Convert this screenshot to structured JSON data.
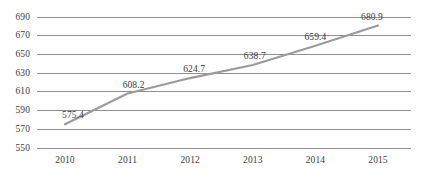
{
  "chart_data": {
    "type": "line",
    "title": "",
    "subtitle": "",
    "xlabel": "",
    "ylabel": "",
    "categories": [
      "2010",
      "2011",
      "2012",
      "2013",
      "2014",
      "2015"
    ],
    "series": [
      {
        "name": "",
        "values": [
          575.4,
          608.2,
          624.7,
          638.7,
          659.4,
          680.9
        ]
      }
    ],
    "point_labels": [
      "575.4",
      "608.2",
      "624.7",
      "638.7",
      "659.4",
      "680.9"
    ],
    "ylim": [
      550,
      690
    ],
    "ytick_values": [
      690,
      670,
      650,
      630,
      610,
      590,
      570,
      550
    ],
    "ytick_labels": [
      "690",
      "670",
      "650",
      "630",
      "610",
      "590",
      "570",
      "550"
    ],
    "xtick_labels": [
      "2010",
      "2011",
      "2012",
      "2013",
      "2014",
      "2015"
    ],
    "grid": true,
    "grid_axis": "y",
    "legend": false,
    "legend_position": "none",
    "markers": false,
    "colors": {
      "line": "#9a9a9a",
      "grid": "#8e8e8e",
      "text": "#3a3a3a",
      "background": "#ffffff"
    }
  }
}
